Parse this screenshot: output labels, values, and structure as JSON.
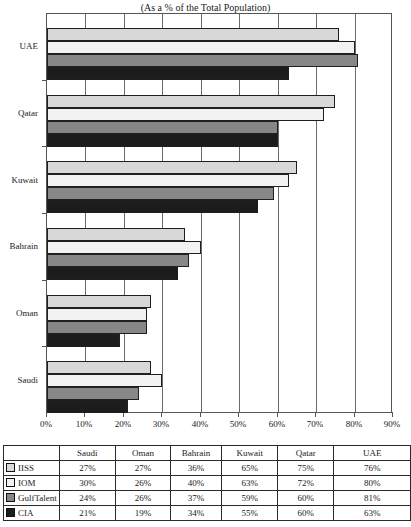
{
  "title": "(As a % of the Total Population)",
  "chart_data": {
    "type": "bar",
    "orientation": "horizontal",
    "title": "(As a % of the Total Population)",
    "categories_top_to_bottom": [
      "UAE",
      "Qatar",
      "Kuwait",
      "Bahrain",
      "Oman",
      "Saudi"
    ],
    "series": [
      {
        "name": "IISS",
        "color": "#d8d8d8",
        "values": {
          "UAE": 76,
          "Qatar": 75,
          "Kuwait": 65,
          "Bahrain": 36,
          "Oman": 27,
          "Saudi": 27
        }
      },
      {
        "name": "IOM",
        "color": "#f2f2f2",
        "values": {
          "UAE": 80,
          "Qatar": 72,
          "Kuwait": 63,
          "Bahrain": 40,
          "Oman": 26,
          "Saudi": 30
        }
      },
      {
        "name": "GulfTalent",
        "color": "#878787",
        "values": {
          "UAE": 81,
          "Qatar": 60,
          "Kuwait": 59,
          "Bahrain": 37,
          "Oman": 26,
          "Saudi": 24
        }
      },
      {
        "name": "CIA",
        "color": "#1c1c1c",
        "values": {
          "UAE": 63,
          "Qatar": 60,
          "Kuwait": 55,
          "Bahrain": 34,
          "Oman": 19,
          "Saudi": 21
        }
      }
    ],
    "xlim": [
      0,
      90
    ],
    "x_tick_step": 10,
    "x_tick_labels": [
      "0%",
      "10%",
      "20%",
      "30%",
      "40%",
      "50%",
      "60%",
      "70%",
      "80%",
      "90%"
    ],
    "grid": true,
    "legend_position": "table-below"
  },
  "table": {
    "columns": [
      "",
      "Saudi",
      "Oman",
      "Bahrain",
      "Kuwait",
      "Qatar",
      "UAE"
    ],
    "rows": [
      {
        "label": "IISS",
        "swatch_color": "#d8d8d8",
        "values": [
          "27%",
          "27%",
          "36%",
          "65%",
          "75%",
          "76%"
        ]
      },
      {
        "label": "IOM",
        "swatch_color": "#f2f2f2",
        "values": [
          "30%",
          "26%",
          "40%",
          "63%",
          "72%",
          "80%"
        ]
      },
      {
        "label": "GulfTalent",
        "swatch_color": "#878787",
        "values": [
          "24%",
          "26%",
          "37%",
          "59%",
          "60%",
          "81%"
        ]
      },
      {
        "label": "CIA",
        "swatch_color": "#1c1c1c",
        "values": [
          "21%",
          "19%",
          "34%",
          "55%",
          "60%",
          "63%"
        ]
      }
    ]
  }
}
